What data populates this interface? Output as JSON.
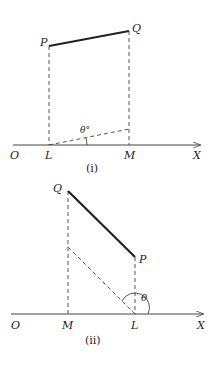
{
  "figure_i": {
    "labels": {
      "P": "P",
      "Q": "Q",
      "O": "O",
      "L": "L",
      "M": "M",
      "X": "X",
      "angle": "θ°"
    },
    "caption": "(i)"
  },
  "figure_ii": {
    "labels": {
      "P": "P",
      "Q": "Q",
      "O": "O",
      "L": "L",
      "M": "M",
      "X": "X",
      "angle": "θ"
    },
    "caption": "(ii)"
  },
  "colors": {
    "line": "#222222",
    "background": "#ffffff"
  }
}
